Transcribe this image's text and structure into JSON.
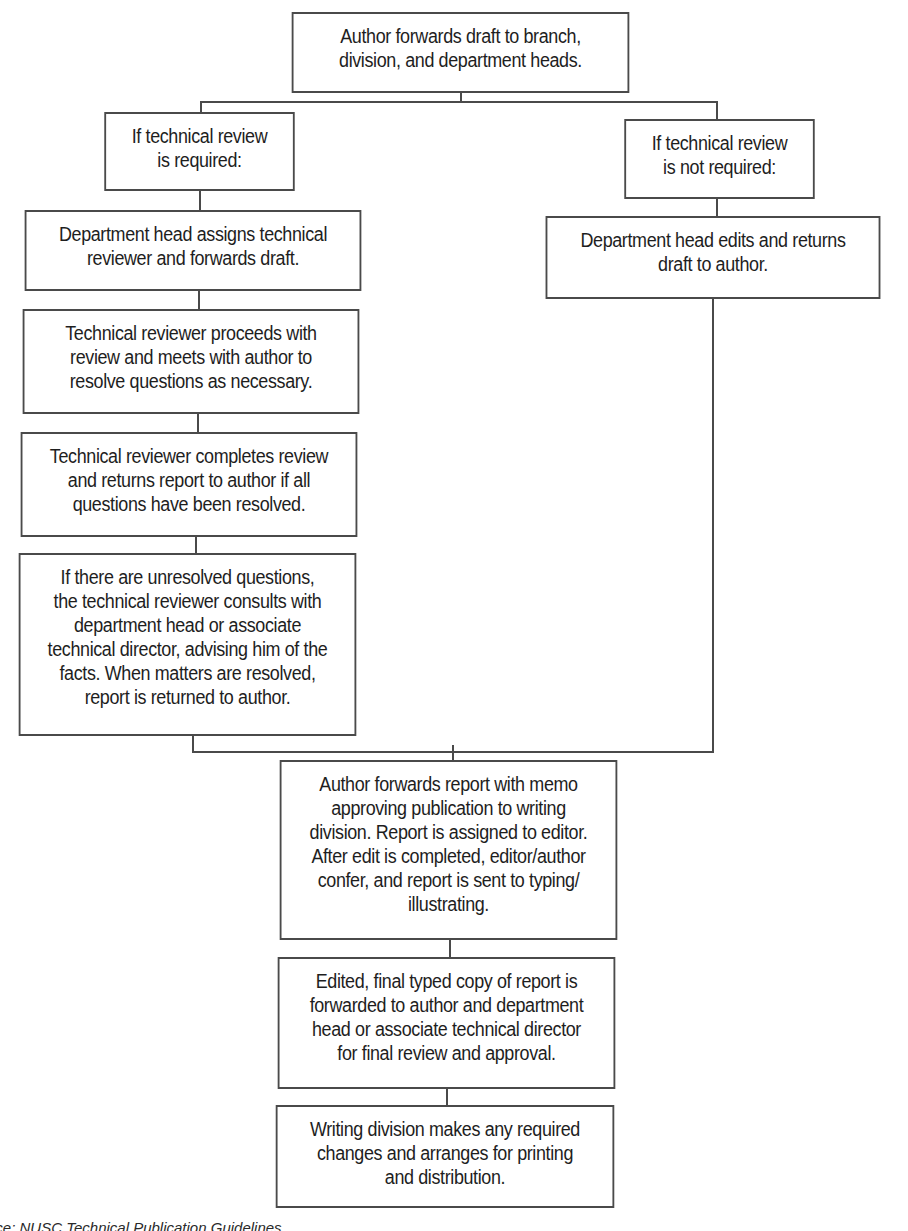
{
  "diagram": {
    "type": "flowchart",
    "nodes": [
      {
        "id": "n1",
        "text": "Author forwards draft to branch,\ndivision, and department heads."
      },
      {
        "id": "n2",
        "text": "If technical review\nis required:"
      },
      {
        "id": "n3",
        "text": "If technical review\nis not required:"
      },
      {
        "id": "n4",
        "text": "Department head assigns technical\nreviewer and forwards draft."
      },
      {
        "id": "n5",
        "text": "Department head edits and returns\ndraft to author."
      },
      {
        "id": "n6",
        "text": "Technical reviewer proceeds with\nreview and meets with author to\nresolve questions as necessary."
      },
      {
        "id": "n7",
        "text": "Technical reviewer completes review\nand returns report to author if all\nquestions have been resolved."
      },
      {
        "id": "n8",
        "text": "If there are unresolved questions,\nthe technical reviewer consults with\ndepartment head or associate\ntechnical director, advising him of the\nfacts. When matters are resolved,\nreport is returned to author."
      },
      {
        "id": "n9",
        "text": "Author forwards report with memo\napproving publication to writing\ndivision. Report is assigned to editor.\nAfter edit is completed, editor/author\nconfer, and report is sent to typing/\nillustrating."
      },
      {
        "id": "n10",
        "text": "Edited, final typed copy of report is\nforwarded to author and department\nhead or associate technical director\nfor final review and approval."
      },
      {
        "id": "n11",
        "text": "Writing division makes any required\nchanges and arranges for printing\nand distribution."
      }
    ],
    "edges": [
      [
        "n1",
        "n2"
      ],
      [
        "n1",
        "n3"
      ],
      [
        "n2",
        "n4"
      ],
      [
        "n4",
        "n6"
      ],
      [
        "n6",
        "n7"
      ],
      [
        "n7",
        "n8"
      ],
      [
        "n3",
        "n5"
      ],
      [
        "n8",
        "n9"
      ],
      [
        "n5",
        "n9"
      ],
      [
        "n9",
        "n10"
      ],
      [
        "n10",
        "n11"
      ]
    ]
  },
  "footer": {
    "source_text": "urce: NUSC Technical Publication Guidelines"
  },
  "colors": {
    "line": "#4a4a4a",
    "text": "#1e1e1e",
    "background": "#ffffff"
  }
}
